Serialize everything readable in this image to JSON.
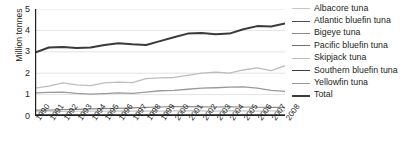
{
  "chart_data": {
    "type": "line",
    "title": "",
    "xlabel": "",
    "ylabel": "Million tonnes",
    "ylim": [
      0,
      5
    ],
    "yticks": [
      0,
      1,
      2,
      3,
      4,
      5
    ],
    "grid": true,
    "legend_position": "right",
    "x": [
      1990,
      1991,
      1992,
      1993,
      1994,
      1995,
      1996,
      1997,
      1998,
      1999,
      2000,
      2001,
      2002,
      2003,
      2004,
      2005,
      2006,
      2007,
      2008
    ],
    "categories": [
      "1990",
      "1991",
      "1992",
      "1993",
      "1994",
      "1995",
      "1996",
      "1997",
      "1998",
      "1999",
      "2000",
      "2001",
      "2002",
      "2003",
      "2004",
      "2005",
      "2006",
      "2007",
      "2008"
    ],
    "series": [
      {
        "name": "Albacore tuna",
        "color": "#c6c6c6",
        "width": 1.1,
        "values": [
          0.22,
          0.23,
          0.21,
          0.22,
          0.23,
          0.22,
          0.24,
          0.23,
          0.24,
          0.23,
          0.24,
          0.25,
          0.24,
          0.23,
          0.25,
          0.24,
          0.23,
          0.24,
          0.24
        ]
      },
      {
        "name": "Atlantic bluefin tuna",
        "color": "#4d4d4d",
        "width": 1.4,
        "values": [
          0.05,
          0.05,
          0.05,
          0.05,
          0.05,
          0.05,
          0.05,
          0.05,
          0.05,
          0.05,
          0.05,
          0.05,
          0.05,
          0.05,
          0.05,
          0.05,
          0.05,
          0.04,
          0.04
        ]
      },
      {
        "name": "Bigeye tuna",
        "color": "#8c8c8c",
        "width": 1.2,
        "values": [
          0.27,
          0.28,
          0.3,
          0.31,
          0.33,
          0.34,
          0.36,
          0.38,
          0.4,
          0.42,
          0.44,
          0.44,
          0.43,
          0.42,
          0.43,
          0.42,
          0.41,
          0.4,
          0.4
        ]
      },
      {
        "name": "Pacific bluefin tuna",
        "color": "#6e6e6e",
        "width": 1.2,
        "values": [
          0.03,
          0.03,
          0.03,
          0.03,
          0.03,
          0.03,
          0.03,
          0.03,
          0.03,
          0.03,
          0.03,
          0.03,
          0.03,
          0.03,
          0.03,
          0.03,
          0.03,
          0.03,
          0.03
        ]
      },
      {
        "name": "Skipjack tuna",
        "color": "#bdbdbd",
        "width": 1.3,
        "values": [
          1.3,
          1.4,
          1.55,
          1.45,
          1.42,
          1.55,
          1.58,
          1.56,
          1.75,
          1.78,
          1.8,
          1.9,
          2.0,
          2.05,
          2.0,
          2.15,
          2.25,
          2.12,
          2.35
        ]
      },
      {
        "name": "Southern bluefin tuna",
        "color": "#3f3f3f",
        "width": 1.4,
        "values": [
          0.02,
          0.02,
          0.02,
          0.02,
          0.02,
          0.02,
          0.02,
          0.02,
          0.02,
          0.02,
          0.02,
          0.02,
          0.02,
          0.02,
          0.02,
          0.02,
          0.02,
          0.02,
          0.02
        ]
      },
      {
        "name": "Yellowfin tuna",
        "color": "#9a9a9a",
        "width": 1.3,
        "values": [
          1.08,
          1.1,
          1.12,
          1.06,
          1.02,
          1.05,
          1.08,
          1.06,
          1.12,
          1.18,
          1.2,
          1.25,
          1.3,
          1.32,
          1.35,
          1.36,
          1.3,
          1.2,
          1.15
        ]
      },
      {
        "name": "Total",
        "color": "#3a3a3a",
        "width": 2.0,
        "values": [
          2.97,
          3.2,
          3.22,
          3.18,
          3.2,
          3.32,
          3.4,
          3.35,
          3.32,
          3.5,
          3.68,
          3.85,
          3.88,
          3.82,
          3.85,
          4.05,
          4.2,
          4.18,
          4.32
        ]
      }
    ]
  },
  "axis": {
    "y_title": "Million tonnes",
    "y_tick_labels": [
      "5",
      "4",
      "3",
      "2",
      "1",
      "0"
    ]
  },
  "legend": {
    "items": [
      {
        "label": "Albacore tuna"
      },
      {
        "label": "Atlantic bluefin tuna"
      },
      {
        "label": "Bigeye tuna"
      },
      {
        "label": "Pacific bluefin tuna"
      },
      {
        "label": "Skipjack tuna"
      },
      {
        "label": "Southern bluefin tuna"
      },
      {
        "label": "Yellowfin tuna"
      },
      {
        "label": "Total"
      }
    ]
  }
}
